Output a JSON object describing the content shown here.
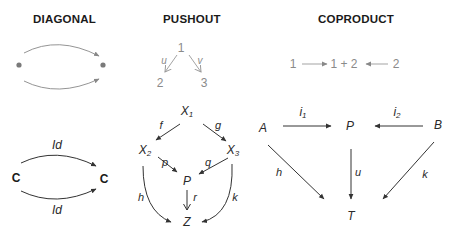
{
  "panels": {
    "diagonal": {
      "title": "DIAGONAL",
      "top": {
        "nodes": [
          "•",
          "•"
        ]
      },
      "bottom": {
        "source": "C",
        "target": "C",
        "top_arrow_label": "Id",
        "bottom_arrow_label": "Id"
      }
    },
    "pushout": {
      "title": "PUSHOUT",
      "top": {
        "apex": "1",
        "left_label": "u",
        "right_label": "v",
        "left_node": "2",
        "right_node": "3"
      },
      "bottom": {
        "x1": "X",
        "x1_sub": "1",
        "x2": "X",
        "x2_sub": "2",
        "x3": "X",
        "x3_sub": "3",
        "f": "f",
        "g": "g",
        "p": "p",
        "q": "q",
        "P": "P",
        "r": "r",
        "h": "h",
        "k": "k",
        "Z": "Z"
      }
    },
    "coproduct": {
      "title": "COPRODUCT",
      "top": {
        "left": "1",
        "middle": "1 + 2",
        "right": "2"
      },
      "bottom": {
        "A": "A",
        "B": "B",
        "P": "P",
        "T": "T",
        "i1": "i",
        "i1_sub": "1",
        "i2": "i",
        "i2_sub": "2",
        "h": "h",
        "u": "u",
        "k": "k"
      }
    }
  },
  "colors": {
    "dark": "#2a2a2a",
    "gray": "#8a8a8a",
    "dot": "#7a7a7a"
  }
}
